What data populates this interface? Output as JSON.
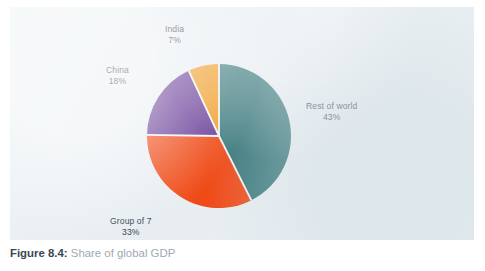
{
  "figure": {
    "number_label": "Figure 8.4",
    "separator": ":",
    "title": "Share of global GDP"
  },
  "panel": {
    "background_color": "#e9eff2"
  },
  "labels": {
    "rest_of_world": {
      "name": "Rest of world",
      "pct": "43%"
    },
    "group_of_7": {
      "name": "Group of 7",
      "pct": "33%"
    },
    "china": {
      "name": "China",
      "pct": "18%"
    },
    "india": {
      "name": "India",
      "pct": "7%"
    }
  },
  "chart_data": {
    "type": "pie",
    "title": "Share of global GDP",
    "xlabel": "",
    "ylabel": "",
    "units": "percent of global GDP",
    "start_angle_deg": 0,
    "direction": "clockwise",
    "grid": false,
    "legend": "none (direct slice labels)",
    "total": 101,
    "categories": [
      "Rest of world",
      "Group of 7",
      "China",
      "India"
    ],
    "values": [
      43,
      33,
      18,
      7
    ],
    "labels": [
      "43%",
      "33%",
      "18%",
      "7%"
    ],
    "colors": [
      "#3c7a7d",
      "#ef4b18",
      "#663a96",
      "#ee9a22"
    ],
    "slices": [
      {
        "label": "Rest of world",
        "value": 43,
        "display": "43%",
        "color": "#3c7a7d",
        "start_deg": 0,
        "end_deg": 154.8
      },
      {
        "label": "Group of 7",
        "value": 33,
        "display": "33%",
        "color": "#ef4b18",
        "start_deg": 154.8,
        "end_deg": 273.6
      },
      {
        "label": "China",
        "value": 18,
        "display": "18%",
        "color": "#663a96",
        "start_deg": 273.6,
        "end_deg": 338.4
      },
      {
        "label": "India",
        "value": 7,
        "display": "7%",
        "color": "#ee9a22",
        "start_deg": 338.4,
        "end_deg": 360
      }
    ]
  }
}
